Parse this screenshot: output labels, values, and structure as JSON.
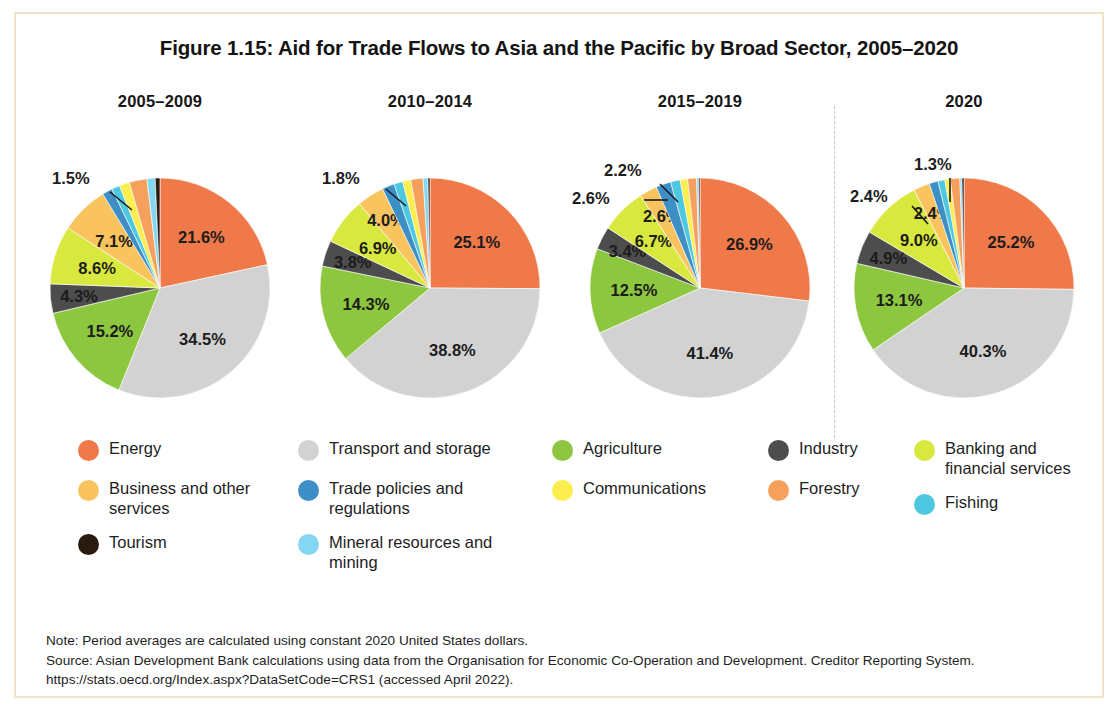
{
  "figure": {
    "title": "Figure 1.15: Aid for Trade Flows to Asia and the Pacific by Broad Sector, 2005–2020",
    "border_color": "#efe4c8"
  },
  "notes": {
    "note": "Note: Period averages are calculated using constant 2020 United States dollars.",
    "source": "Source: Asian Development Bank calculations using data from the Organisation for Economic Co-Operation and Development. Creditor Reporting System. https://stats.oecd.org/Index.aspx?DataSetCode=CRS1 (accessed April 2022)."
  },
  "legend": {
    "columns": [
      [
        {
          "label": "Energy",
          "color": "#F0794A"
        },
        {
          "label": "Business and other services",
          "color": "#F9C35E"
        },
        {
          "label": "Tourism",
          "color": "#2B1A10"
        }
      ],
      [
        {
          "label": "Transport and storage",
          "color": "#D2D2D2"
        },
        {
          "label": "Trade policies and regulations",
          "color": "#3E8FC6"
        },
        {
          "label": "Mineral resources and mining",
          "color": "#85D6F2"
        }
      ],
      [
        {
          "label": "Agriculture",
          "color": "#8DC63F"
        },
        {
          "label": "Communications",
          "color": "#FBEE4E"
        }
      ],
      [
        {
          "label": "Industry",
          "color": "#4D4D4D"
        },
        {
          "label": "Forestry",
          "color": "#F5A05C"
        }
      ],
      [
        {
          "label": "Banking and financial services",
          "color": "#D9E83E"
        },
        {
          "label": "Fishing",
          "color": "#4EC8E0"
        }
      ]
    ]
  },
  "chart_data": {
    "type": "pie",
    "title": "Figure 1.15: Aid for Trade Flows to Asia and the Pacific by Broad Sector, 2005–2020",
    "legend_position": "bottom",
    "units": "percent",
    "sectors": [
      {
        "name": "Energy",
        "color": "#F0794A"
      },
      {
        "name": "Transport and storage",
        "color": "#D2D2D2"
      },
      {
        "name": "Agriculture",
        "color": "#8DC63F"
      },
      {
        "name": "Industry",
        "color": "#4D4D4D"
      },
      {
        "name": "Banking and financial services",
        "color": "#D9E83E"
      },
      {
        "name": "Business and other services",
        "color": "#F9C35E"
      },
      {
        "name": "Trade policies and regulations",
        "color": "#3E8FC6"
      },
      {
        "name": "Fishing",
        "color": "#4EC8E0"
      },
      {
        "name": "Communications",
        "color": "#FBEE4E"
      },
      {
        "name": "Forestry",
        "color": "#F5A05C"
      },
      {
        "name": "Mineral resources and mining",
        "color": "#85D6F2"
      },
      {
        "name": "Tourism",
        "color": "#2B1A10"
      }
    ],
    "panels": [
      {
        "title": "2005–2009",
        "categories": [
          "Energy",
          "Transport and storage",
          "Agriculture",
          "Industry",
          "Banking and financial services",
          "Business and other services",
          "Trade policies and regulations",
          "Fishing",
          "Communications",
          "Forestry",
          "Mineral resources and mining",
          "Tourism"
        ],
        "values": [
          21.6,
          34.5,
          15.2,
          4.3,
          8.6,
          7.1,
          1.5,
          1.2,
          1.5,
          2.6,
          1.2,
          0.7
        ],
        "labels_shown": [
          "21.6%",
          "34.5%",
          "15.2%",
          "4.3%",
          "8.6%",
          "7.1%",
          "1.5%"
        ]
      },
      {
        "title": "2010–2014",
        "categories": [
          "Energy",
          "Transport and storage",
          "Agriculture",
          "Industry",
          "Banking and financial services",
          "Business and other services",
          "Trade policies and regulations",
          "Fishing",
          "Communications",
          "Forestry",
          "Mineral resources and mining",
          "Tourism"
        ],
        "values": [
          25.1,
          38.8,
          14.3,
          3.8,
          6.9,
          4.0,
          1.8,
          1.3,
          1.2,
          1.8,
          0.7,
          0.3
        ],
        "labels_shown": [
          "25.1%",
          "38.8%",
          "14.3%",
          "3.8%",
          "6.9%",
          "4.0%",
          "1.8%"
        ]
      },
      {
        "title": "2015–2019",
        "categories": [
          "Energy",
          "Transport and storage",
          "Agriculture",
          "Industry",
          "Banking and financial services",
          "Business and other services",
          "Trade policies and regulations",
          "Fishing",
          "Communications",
          "Forestry",
          "Mineral resources and mining",
          "Tourism"
        ],
        "values": [
          26.9,
          41.4,
          12.5,
          3.4,
          6.7,
          2.6,
          2.2,
          1.4,
          1.1,
          1.3,
          0.3,
          0.2
        ],
        "labels_shown": [
          "26.9%",
          "41.4%",
          "12.5%",
          "3.4%",
          "6.7%",
          "2.6%",
          "2.2%"
        ]
      },
      {
        "title": "2020",
        "categories": [
          "Energy",
          "Transport and storage",
          "Agriculture",
          "Industry",
          "Banking and financial services",
          "Business and other services",
          "Trade policies and regulations",
          "Fishing",
          "Communications",
          "Forestry",
          "Mineral resources and mining",
          "Tourism"
        ],
        "values": [
          25.2,
          40.3,
          13.1,
          4.9,
          9.0,
          2.4,
          1.3,
          1.0,
          0.8,
          1.4,
          0.3,
          0.3
        ],
        "labels_shown": [
          "25.2%",
          "40.3%",
          "13.1%",
          "4.9%",
          "9.0%",
          "2.4%",
          "1.3%"
        ]
      }
    ]
  }
}
